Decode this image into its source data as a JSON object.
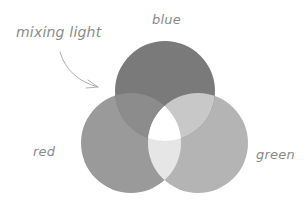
{
  "diagram": {
    "title": "mixing light",
    "circles": [
      {
        "id": "blue",
        "label": "blue",
        "cx": 165,
        "cy": 91,
        "r": 50,
        "color": "#7a7a7a"
      },
      {
        "id": "red",
        "label": "red",
        "cx": 131,
        "cy": 143,
        "r": 50,
        "color": "#9a9a9a"
      },
      {
        "id": "green",
        "label": "green",
        "cx": 198,
        "cy": 143,
        "r": 50,
        "color": "#b4b4b4"
      }
    ],
    "overlaps": {
      "blue_red": "#8c8c8c",
      "blue_green": "#c8c8c8",
      "red_green": "#e6e6e6",
      "all": "#ffffff"
    },
    "arrow": {
      "color": "#b0b0b0",
      "from": [
        60,
        52
      ],
      "to": [
        98,
        87
      ]
    },
    "label_color": "#8a8a8a",
    "background": "#ffffff"
  }
}
